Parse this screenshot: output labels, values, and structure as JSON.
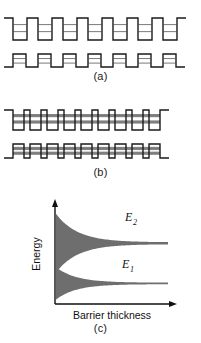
{
  "figure": {
    "type": "scientific-diagram",
    "background_color": "#ffffff",
    "line_color": "#1a1a1a",
    "fill_color": "#6e6e6e",
    "level_line_color": "#7a7a7a"
  },
  "panels": [
    {
      "id": "a",
      "caption": "(a)",
      "description": "Isolated quantum wells with thick barriers; discrete levels",
      "rows": [
        {
          "id": "a-top",
          "kind": "wells",
          "periods": 7,
          "well_width": 14,
          "barrier_width": 11,
          "depth": 22,
          "levels": [
            0.3,
            0.62
          ]
        },
        {
          "id": "a-bottom",
          "kind": "barriers",
          "periods": 7,
          "barrier_width": 13,
          "well_width": 12,
          "height": 13,
          "levels": [
            0.35,
            0.7
          ]
        }
      ]
    },
    {
      "id": "b",
      "caption": "(b)",
      "description": "Coupled quantum wells with thin barriers; levels broaden into bands",
      "rows": [
        {
          "id": "b-top",
          "kind": "wells",
          "periods": 9,
          "well_width": 11,
          "barrier_width": 6,
          "depth": 20,
          "band_fill": true,
          "levels": [
            0.28,
            0.6
          ]
        },
        {
          "id": "b-bottom",
          "kind": "barriers",
          "periods": 9,
          "barrier_width": 11,
          "well_width": 6,
          "height": 14,
          "band_fill": true,
          "levels": [
            0.32,
            0.66
          ]
        }
      ]
    },
    {
      "id": "c",
      "caption": "(c)",
      "description": "Band width versus barrier thickness"
    }
  ],
  "chart_data": {
    "type": "area",
    "title": "",
    "xlabel": "Barrier thickness",
    "ylabel": "Energy",
    "grid": false,
    "legend": "none",
    "axis_arrows": true,
    "xlim": [
      0,
      1
    ],
    "ylim": [
      0,
      1
    ],
    "series": [
      {
        "name": "E_2",
        "label": "E",
        "subscript": "2",
        "label_x": 0.62,
        "label_y": 0.8,
        "band_center": 0.62,
        "band_half_width_at_x0": 0.3,
        "band_half_width_at_x1": 0.01,
        "decay": 5.2,
        "fill": "#6e6e6e"
      },
      {
        "name": "E_1",
        "label": "E",
        "subscript": "1",
        "label_x": 0.6,
        "label_y": 0.36,
        "band_center": 0.21,
        "band_half_width_at_x0": 0.165,
        "band_half_width_at_x1": 0.008,
        "decay": 5.6,
        "fill": "#6e6e6e"
      }
    ]
  },
  "labels": {
    "energy_axis": "Energy",
    "barrier_axis": "Barrier thickness",
    "e2": "E",
    "e2_sub": "2",
    "e1": "E",
    "e1_sub": "1",
    "caption_a": "(a)",
    "caption_b": "(b)",
    "caption_c": "(c)"
  }
}
